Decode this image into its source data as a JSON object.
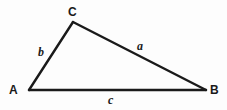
{
  "figure": {
    "kind": "geometry-diagram",
    "shape": "triangle",
    "background_color": "#fdfdfd",
    "stroke_color": "#1a1a1a",
    "text_color": "#1a1a1a"
  },
  "vertices": [
    {
      "id": "A",
      "label": "A",
      "x": 29,
      "y": 90
    },
    {
      "id": "B",
      "label": "B",
      "x": 206,
      "y": 90
    },
    {
      "id": "C",
      "label": "C",
      "x": 73,
      "y": 22
    }
  ],
  "sides": [
    {
      "id": "a",
      "label": "a",
      "from": "B",
      "to": "C",
      "style": "italic"
    },
    {
      "id": "b",
      "label": "b",
      "from": "A",
      "to": "C",
      "style": "italic"
    },
    {
      "id": "c",
      "label": "c",
      "from": "A",
      "to": "B",
      "style": "italic"
    }
  ],
  "chart_data": {
    "type": "scatter",
    "title": "",
    "xlabel": "",
    "ylabel": "",
    "xlim": [
      0,
      227
    ],
    "ylim": [
      0,
      110
    ],
    "grid": false,
    "legend": "none",
    "points": [
      {
        "name": "A",
        "x": 29,
        "y": 90
      },
      {
        "name": "B",
        "x": 206,
        "y": 90
      },
      {
        "name": "C",
        "x": 73,
        "y": 22
      }
    ],
    "edges": [
      {
        "name": "c",
        "from": "A",
        "to": "B"
      },
      {
        "name": "b",
        "from": "A",
        "to": "C"
      },
      {
        "name": "a",
        "from": "C",
        "to": "B"
      }
    ],
    "annotations": [
      "A",
      "B",
      "C",
      "a",
      "b",
      "c"
    ]
  }
}
